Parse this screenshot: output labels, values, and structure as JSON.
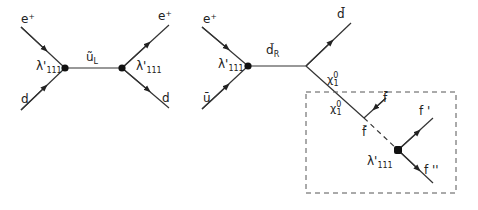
{
  "diagram": {
    "type": "feynman",
    "colors": {
      "line": "#333333",
      "vertex": "#111111",
      "box": "#555555"
    },
    "left": {
      "labels": {
        "in_top": "e⁺",
        "in_bottom": "d",
        "coupling_left": "λ'",
        "coupling_left_sub": "111",
        "propagator": "ũ",
        "propagator_sub": "L",
        "coupling_right": "λ'",
        "coupling_right_sub": "111",
        "out_top": "e⁺",
        "out_bottom": "d"
      }
    },
    "right": {
      "labels": {
        "in_top": "e⁺",
        "in_bottom": "ū",
        "coupling": "λ'",
        "coupling_sub": "111",
        "propagator": "d̃",
        "propagator_sub": "R",
        "out_top": "d̄",
        "neutralino_upper": "χ",
        "neutralino_upper_sup": "0",
        "neutralino_upper_sub": "1",
        "neutralino_box": "χ",
        "neutralino_box_sup": "0",
        "neutralino_box_sub": "1",
        "fbar": "f̄",
        "sfermion": "f̃",
        "coupling_box": "λ'",
        "coupling_box_sub": "111",
        "f_prime": "f '",
        "f_double_prime": "f ''"
      }
    }
  }
}
